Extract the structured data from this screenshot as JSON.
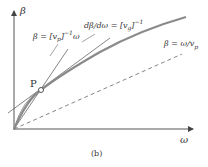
{
  "figure": {
    "caption": "(b)",
    "axes": {
      "y_label": "β",
      "x_label": "ω"
    },
    "point_label": "P",
    "annotations": {
      "phase_line": {
        "lhs": "β = [v",
        "sub": "p",
        "rhs": "]",
        "sup": "−1",
        "tail": "ω"
      },
      "group_tangent": {
        "lhs": "dβ/dω = [v",
        "sub": "g",
        "rhs": "]",
        "sup": "−1"
      },
      "dashed_line": {
        "lhs": "β = ω/v",
        "sub": "p"
      }
    },
    "colors": {
      "curve": "#8a8a8a",
      "axes": "#555555",
      "lines": "#666666",
      "dashed": "#777777"
    }
  }
}
